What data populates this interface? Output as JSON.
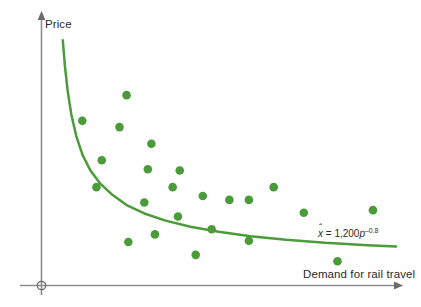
{
  "chart_data": {
    "type": "scatter",
    "title": "",
    "xlabel": "Demand for rail travel",
    "ylabel": "Price",
    "annotation": "x̂ = 1,200p⁻⁰⋅⁸",
    "annotation_parts": {
      "variable": "x",
      "hat": "ˆ",
      "equals": "=",
      "coefficient": "1,200",
      "base": "p",
      "exponent": "–0.8"
    },
    "grid": false,
    "legend": false,
    "axis_style": "arrows-both",
    "origin_marker": "circle",
    "series_color": "#4b9b3a",
    "curve_color": "#4b9b3a",
    "axis_color": "#8a8a8a",
    "text_color": "#2b2b2b",
    "background": "#ffffff",
    "xlim": [
      0,
      100
    ],
    "ylim": [
      0,
      100
    ],
    "fit_curve": {
      "name": "fitted demand curve",
      "equation": "x = 1,200 * p^-0.8",
      "points": [
        [
          6.0,
          96.0
        ],
        [
          6.6,
          86.0
        ],
        [
          7.4,
          76.0
        ],
        [
          8.4,
          67.0
        ],
        [
          9.8,
          58.5
        ],
        [
          11.6,
          51.0
        ],
        [
          13.8,
          45.0
        ],
        [
          16.5,
          40.0
        ],
        [
          20.0,
          35.5
        ],
        [
          24.0,
          31.5
        ],
        [
          29.0,
          28.2
        ],
        [
          35.0,
          25.4
        ],
        [
          42.0,
          23.0
        ],
        [
          50.0,
          21.0
        ],
        [
          59.0,
          19.3
        ],
        [
          69.0,
          17.9
        ],
        [
          80.0,
          16.7
        ],
        [
          92.0,
          15.8
        ],
        [
          100.0,
          15.3
        ]
      ]
    },
    "points": [
      {
        "x": 11.5,
        "y": 64.5
      },
      {
        "x": 24.0,
        "y": 74.5
      },
      {
        "x": 22.0,
        "y": 62.0
      },
      {
        "x": 17.0,
        "y": 49.0
      },
      {
        "x": 31.0,
        "y": 55.5
      },
      {
        "x": 30.0,
        "y": 45.5
      },
      {
        "x": 39.0,
        "y": 45.0
      },
      {
        "x": 15.5,
        "y": 38.5
      },
      {
        "x": 37.0,
        "y": 38.5
      },
      {
        "x": 29.0,
        "y": 32.5
      },
      {
        "x": 45.5,
        "y": 35.0
      },
      {
        "x": 53.0,
        "y": 33.5
      },
      {
        "x": 58.5,
        "y": 33.5
      },
      {
        "x": 65.5,
        "y": 38.5
      },
      {
        "x": 38.5,
        "y": 27.0
      },
      {
        "x": 32.0,
        "y": 20.0
      },
      {
        "x": 48.0,
        "y": 22.0
      },
      {
        "x": 24.5,
        "y": 17.0
      },
      {
        "x": 58.5,
        "y": 17.5
      },
      {
        "x": 43.5,
        "y": 12.0
      },
      {
        "x": 74.0,
        "y": 28.5
      },
      {
        "x": 93.5,
        "y": 29.5
      },
      {
        "x": 83.5,
        "y": 9.5
      }
    ]
  },
  "labels": {
    "y_axis": "Price",
    "x_axis": "Demand for rail travel"
  },
  "equation": {
    "variable": "x",
    "hat": "ˆ",
    "equals": "=",
    "coefficient": "1,200",
    "base": "p",
    "exponent": "–0.8"
  }
}
